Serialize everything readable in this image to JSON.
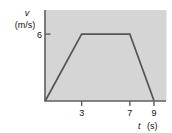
{
  "chart_data": {
    "type": "line",
    "title": "",
    "xlabel": "t (s)",
    "ylabel": "v (m/s)",
    "ylabel_symbol": "v",
    "ylabel_units": "(m/s)",
    "xlabel_symbol": "t",
    "xlabel_units": "(s)",
    "xlim": [
      0,
      10
    ],
    "ylim": [
      0,
      8
    ],
    "xticks": [
      3,
      7,
      9
    ],
    "xtick_labels": [
      "3",
      "7",
      "9"
    ],
    "yticks": [
      6
    ],
    "ytick_labels": [
      "6"
    ],
    "grid": false,
    "legend": null,
    "plot_background": "#d5d5d5",
    "line_color": "#555555",
    "axis_color": "#666666",
    "series": [
      {
        "name": "velocity",
        "x": [
          0,
          3,
          7,
          9
        ],
        "y": [
          0,
          6,
          6,
          0
        ]
      }
    ]
  }
}
